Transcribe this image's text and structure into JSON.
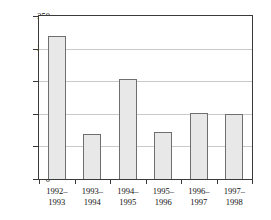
{
  "chart_data": {
    "type": "bar",
    "title": "",
    "subtitle": "",
    "xlabel": "",
    "ylabel": "Percent of normal",
    "ylim": [
      0,
      250
    ],
    "yticks": [
      0,
      50,
      100,
      150,
      200,
      250
    ],
    "ytick_labels": [
      "0",
      "50",
      "100",
      "150",
      "200",
      "250"
    ],
    "grid": true,
    "legend": "none",
    "categories": [
      "1992–1993",
      "1993–1994",
      "1994–1995",
      "1995–1996",
      "1996–1997",
      "1997–1998"
    ],
    "category_lines": [
      [
        "1992–",
        "1993"
      ],
      [
        "1993–",
        "1994"
      ],
      [
        "1994–",
        "1995"
      ],
      [
        "1995–",
        "1996"
      ],
      [
        "1996–",
        "1997"
      ],
      [
        "1997–",
        "1998"
      ]
    ],
    "values": [
      220,
      70,
      155,
      73,
      102,
      100
    ],
    "colors": {
      "bar_fill": "#e8e8e8",
      "bar_border": "#6f6f6f",
      "axis": "#3a3a3a",
      "grid": "#c9c9c9",
      "text": "#111111",
      "background": "#ffffff"
    }
  }
}
